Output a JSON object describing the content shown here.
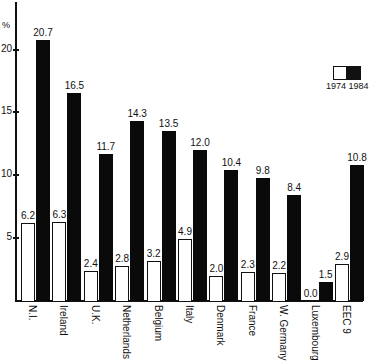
{
  "chart_data": {
    "type": "bar",
    "title": "",
    "xlabel": "",
    "ylabel": "%",
    "ylim": [
      0,
      22
    ],
    "yticks": [
      5,
      10,
      15,
      20
    ],
    "grid": false,
    "legend_position": "top-right",
    "categories": [
      "N.I.",
      "Ireland",
      "U.K.",
      "Netherlands",
      "Belgium",
      "Italy",
      "Denmark",
      "France",
      "W. Germany",
      "Luxembourg",
      "EEC 9"
    ],
    "series": [
      {
        "name": "1974",
        "color": "#ffffff",
        "values": [
          6.2,
          6.3,
          2.4,
          2.8,
          3.2,
          4.9,
          2.0,
          2.3,
          2.2,
          0.0,
          2.9
        ],
        "labels": [
          "6.2",
          "6.3",
          "2.4",
          "2.8",
          "3.2",
          "4.9",
          "2.0",
          "2.3",
          "2.2",
          "0.0",
          "2.9"
        ]
      },
      {
        "name": "1984",
        "color": "#0a0a0a",
        "values": [
          20.7,
          16.5,
          11.7,
          14.3,
          13.5,
          12.0,
          10.4,
          9.8,
          8.4,
          1.5,
          10.8
        ],
        "labels": [
          "20.7",
          "16.5",
          "11.7",
          "14.3",
          "13.5",
          "12.0",
          "10.4",
          "9.8",
          "8.4",
          "1.5",
          "10.8"
        ]
      }
    ]
  },
  "axis": {
    "unit_label": "%",
    "ticks": [
      "5",
      "10",
      "15",
      "20"
    ]
  },
  "legend": {
    "label": "1974 1984"
  }
}
